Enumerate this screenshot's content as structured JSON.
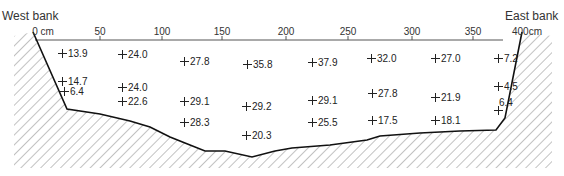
{
  "labels": {
    "west_bank": "West bank",
    "east_bank": "East bank"
  },
  "axis": {
    "ticks": [
      {
        "label": "0 cm",
        "x": 43
      },
      {
        "label": "50",
        "x": 100
      },
      {
        "label": "100",
        "x": 162
      },
      {
        "label": "150",
        "x": 222
      },
      {
        "label": "200",
        "x": 286
      },
      {
        "label": "250",
        "x": 348
      },
      {
        "label": "300",
        "x": 412
      },
      {
        "label": "350",
        "x": 473
      },
      {
        "label": "400cm",
        "x": 527
      }
    ]
  },
  "measurements": [
    {
      "value": "13.9",
      "x": 58,
      "y": 49
    },
    {
      "value": "24.0",
      "x": 118,
      "y": 50
    },
    {
      "value": "27.8",
      "x": 180,
      "y": 57
    },
    {
      "value": "35.8",
      "x": 243,
      "y": 60
    },
    {
      "value": "37.9",
      "x": 308,
      "y": 58
    },
    {
      "value": "32.0",
      "x": 367,
      "y": 54
    },
    {
      "value": "27.0",
      "x": 431,
      "y": 54
    },
    {
      "value": "7.2",
      "x": 494,
      "y": 54
    },
    {
      "value": "14.7",
      "x": 58,
      "y": 77
    },
    {
      "value": "6.4",
      "x": 60,
      "y": 87
    },
    {
      "value": "24.0",
      "x": 118,
      "y": 83
    },
    {
      "value": "27.8",
      "x": 368,
      "y": 89
    },
    {
      "value": "21.9",
      "x": 431,
      "y": 93
    },
    {
      "value": "4.5",
      "x": 494,
      "y": 82
    },
    {
      "value": "22.6",
      "x": 118,
      "y": 97
    },
    {
      "value": "29.1",
      "x": 180,
      "y": 97
    },
    {
      "value": "29.2",
      "x": 242,
      "y": 102
    },
    {
      "value": "29.1",
      "x": 308,
      "y": 96
    },
    {
      "value": "28.3",
      "x": 180,
      "y": 118
    },
    {
      "value": "25.5",
      "x": 308,
      "y": 118
    },
    {
      "value": "17.5",
      "x": 368,
      "y": 116
    },
    {
      "value": "18.1",
      "x": 431,
      "y": 116
    },
    {
      "value": "20.3",
      "x": 242,
      "y": 131
    }
  ],
  "east_low_point": {
    "value": "6.4",
    "label_x": 499,
    "label_y": 98,
    "plus_x": 494,
    "plus_y": 107
  }
}
